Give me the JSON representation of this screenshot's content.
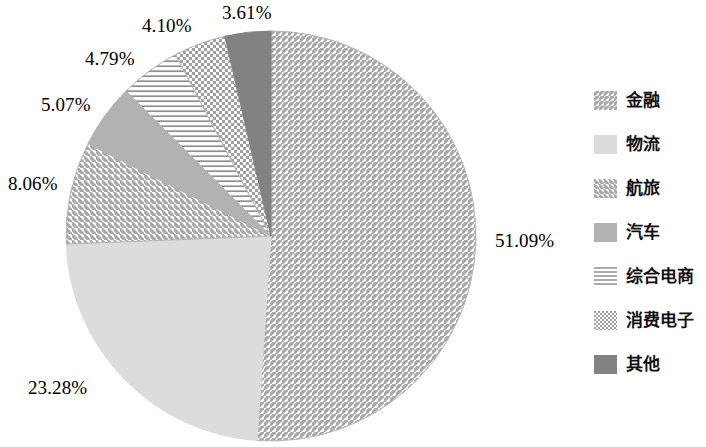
{
  "chart_data": {
    "type": "pie",
    "title": "",
    "subtitle": "",
    "xlabel": "",
    "ylabel": "",
    "grid": false,
    "legend_position": "right",
    "start_angle_deg": 0,
    "direction": "clockwise",
    "units": "percent",
    "total": 100.0,
    "categories": [
      "金融",
      "物流",
      "航旅",
      "汽车",
      "综合电商",
      "消费电子",
      "其他"
    ],
    "values": [
      51.09,
      23.28,
      8.06,
      5.07,
      4.79,
      4.1,
      3.61
    ],
    "value_labels": [
      "51.09%",
      "23.28%",
      "8.06%",
      "5.07%",
      "4.79%",
      "4.10%",
      "3.61%"
    ],
    "slices": [
      {
        "label": "金融",
        "value": 51.09,
        "value_label": "51.09%",
        "pattern": "diagonal-forward-hatch",
        "fill": "#ffffff",
        "stroke": "#9a9a9a"
      },
      {
        "label": "物流",
        "value": 23.28,
        "value_label": "23.28%",
        "pattern": "solid",
        "fill": "#dcdcdc",
        "stroke": "#dcdcdc"
      },
      {
        "label": "航旅",
        "value": 8.06,
        "value_label": "8.06%",
        "pattern": "diagonal-back-hatch",
        "fill": "#ffffff",
        "stroke": "#9a9a9a"
      },
      {
        "label": "汽车",
        "value": 5.07,
        "value_label": "5.07%",
        "pattern": "solid",
        "fill": "#b2b2b2",
        "stroke": "#b2b2b2"
      },
      {
        "label": "综合电商",
        "value": 4.79,
        "value_label": "4.79%",
        "pattern": "horizontal-lines",
        "fill": "#ffffff",
        "stroke": "#8f8f8f"
      },
      {
        "label": "消费电子",
        "value": 4.1,
        "value_label": "4.10%",
        "pattern": "dotted-checker",
        "fill": "#ffffff",
        "stroke": "#9a9a9a"
      },
      {
        "label": "其他",
        "value": 3.61,
        "value_label": "3.61%",
        "pattern": "solid",
        "fill": "#828282",
        "stroke": "#828282"
      }
    ]
  },
  "legend": {
    "items": [
      {
        "label": "金融"
      },
      {
        "label": "物流"
      },
      {
        "label": "航旅"
      },
      {
        "label": "汽车"
      },
      {
        "label": "综合电商"
      },
      {
        "label": "消费电子"
      },
      {
        "label": "其他"
      }
    ]
  },
  "labels": {
    "finance": "51.09%",
    "logistics": "23.28%",
    "travel": "8.06%",
    "automotive": "5.07%",
    "ecommerce": "4.79%",
    "electronics": "4.10%",
    "other": "3.61%"
  }
}
